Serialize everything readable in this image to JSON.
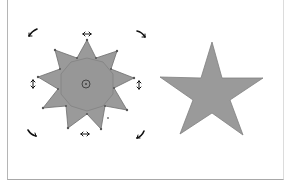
{
  "canvas": {
    "background": "#ffffff",
    "shape_fill": "#9a9a9a",
    "shape_stroke": "#707070",
    "handle_color": "#222222"
  },
  "shapes": [
    {
      "name": "ten-point-star",
      "selected": true,
      "mode": "rotate"
    },
    {
      "name": "five-point-star",
      "selected": false
    }
  ]
}
